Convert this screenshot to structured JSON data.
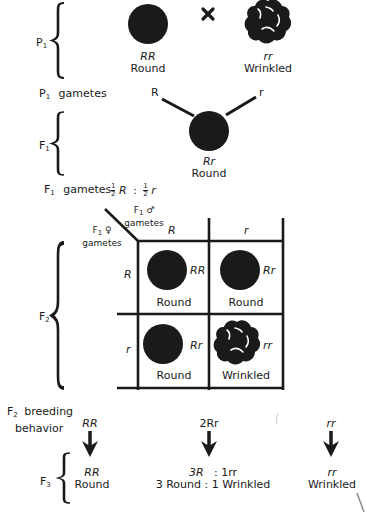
{
  "generations": {
    "p1": {
      "label": "P",
      "sub": "1"
    },
    "p1_gametes": {
      "label": "P",
      "sub": "1",
      "suffix": "gametes"
    },
    "f1": {
      "label": "F",
      "sub": "1"
    },
    "f1_gametes": {
      "label": "F",
      "sub": "1",
      "suffix": "gametes"
    },
    "f2": {
      "label": "F",
      "sub": "2"
    },
    "f2_breeding": {
      "label": "F",
      "sub": "2",
      "line1": "breeding",
      "line2": "behavior"
    },
    "f3": {
      "label": "F",
      "sub": "3"
    }
  },
  "p1_cross": {
    "symbol": "×",
    "left": {
      "genotype": "RR",
      "phenotype": "Round"
    },
    "right": {
      "genotype": "rr",
      "phenotype": "Wrinkled"
    }
  },
  "p1_gamete_labels": {
    "left": "R",
    "right": "r"
  },
  "f1_offspring": {
    "genotype": "Rr",
    "phenotype": "Round"
  },
  "f1_gamete_ratio": {
    "num1": "1",
    "den1": "2",
    "allele1": "R",
    "sep": ":",
    "num2": "1",
    "den2": "2",
    "allele2": "r"
  },
  "punnett": {
    "male_header": {
      "label": "F",
      "sub": "1",
      "symbol": "♂",
      "line2": "gametes"
    },
    "female_header": {
      "label": "F",
      "sub": "1",
      "symbol": "♀",
      "line2": "gametes"
    },
    "columns": [
      "R",
      "r"
    ],
    "rows": [
      "R",
      "r"
    ],
    "cells": [
      [
        {
          "genotype": "RR",
          "phenotype": "Round",
          "shape": "round"
        },
        {
          "genotype": "Rr",
          "phenotype": "Round",
          "shape": "round"
        }
      ],
      [
        {
          "genotype": "Rr",
          "phenotype": "Round",
          "shape": "round"
        },
        {
          "genotype": "rr",
          "phenotype": "Wrinkled",
          "shape": "wrinkled"
        }
      ]
    ]
  },
  "f2_breeding": [
    {
      "genotype": "RR"
    },
    {
      "genotype": "2Rr"
    },
    {
      "genotype": "rr"
    }
  ],
  "f3_results": [
    {
      "line1": "RR",
      "line2": "Round"
    },
    {
      "line1a": "3R",
      "line1b": ": 1rr",
      "line2": "3 Round : 1 Wrinkled"
    },
    {
      "line1": "rr",
      "line2": "Wrinkled"
    }
  ],
  "colors": {
    "ink": "#1a1a1a",
    "background": "#ffffff"
  }
}
